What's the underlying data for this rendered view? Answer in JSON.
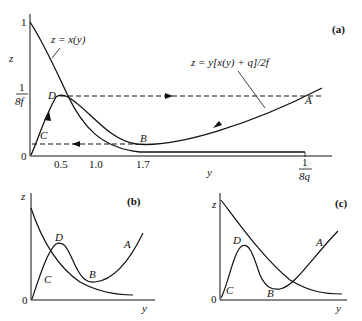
{
  "panels": {
    "a": {
      "tag": "(a)",
      "z_axis_label": "z",
      "y_axis_label": "y",
      "z_ticks": {
        "one": "1",
        "zero": "0",
        "frac_num": "1",
        "frac_den": "8f"
      },
      "y_ticks": [
        "0.5",
        "1.0",
        "1.7"
      ],
      "y_end_tick": {
        "num": "1",
        "den": "8q"
      },
      "curve_x_label": "z = x(y)",
      "curve_nullcline_label": "z = y[x(y) + q]/2f",
      "points": {
        "A": "A",
        "B": "B",
        "C": "C",
        "D": "D"
      }
    },
    "b": {
      "tag": "(b)",
      "z_axis_label": "z",
      "y_axis_label": "y",
      "origin": "0",
      "points": {
        "A": "A",
        "B": "B",
        "C": "C",
        "D": "D"
      }
    },
    "c": {
      "tag": "(c)",
      "z_axis_label": "z",
      "y_axis_label": "y",
      "origin": "0",
      "points": {
        "A": "A",
        "B": "B",
        "C": "C",
        "D": "D"
      }
    }
  }
}
